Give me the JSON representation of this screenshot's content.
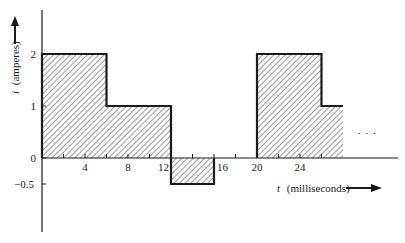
{
  "chart_data": {
    "type": "area",
    "style": "step",
    "title": "",
    "xlabel": "t (milliseconds)",
    "xlabel_var": "t",
    "xlabel_unit": "(milliseconds)",
    "ylabel": "i (amperes)",
    "ylabel_var": "i",
    "ylabel_unit": "(amperes)",
    "xlim": [
      0,
      33
    ],
    "ylim": [
      -1.4,
      2.8
    ],
    "x_ticks": [
      2,
      4,
      6,
      8,
      10,
      12,
      14,
      16,
      18,
      20,
      22,
      24,
      26
    ],
    "x_tick_labels": [
      {
        "value": 4,
        "label": "4"
      },
      {
        "value": 8,
        "label": "8"
      },
      {
        "value": 12,
        "label": "12"
      },
      {
        "value": 16,
        "label": "16"
      },
      {
        "value": 20,
        "label": "20"
      },
      {
        "value": 24,
        "label": "24"
      }
    ],
    "y_tick_labels": [
      {
        "value": 2,
        "label": "2"
      },
      {
        "value": 1,
        "label": "1"
      },
      {
        "value": 0,
        "label": "0"
      },
      {
        "value": -0.5,
        "label": "−0.5"
      }
    ],
    "segments": [
      {
        "t_start": 0,
        "t_end": 6,
        "i": 2
      },
      {
        "t_start": 6,
        "t_end": 12,
        "i": 1
      },
      {
        "t_start": 12,
        "t_end": 16,
        "i": -0.5
      },
      {
        "t_start": 16,
        "t_end": 20,
        "i": 0
      },
      {
        "t_start": 20,
        "t_end": 26,
        "i": 2
      },
      {
        "t_start": 26,
        "t_end": 28,
        "i": 1
      }
    ],
    "annotations": [
      "…"
    ],
    "continuation": "...",
    "fill": "diagonal hatching",
    "grid": false,
    "legend": null
  },
  "labels": {
    "y_var": "i",
    "y_unit": "(amperes)",
    "x_var": "t",
    "x_unit": "(milliseconds)",
    "ellipsis": ". . ."
  },
  "colors": {
    "ink": "#1a1a1a",
    "hatch": "#333333",
    "background": "#ffffff"
  }
}
